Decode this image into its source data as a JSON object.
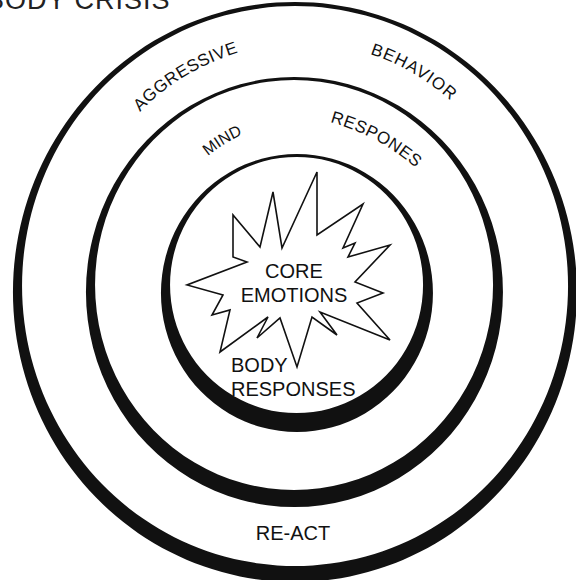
{
  "title": "BODY CRISIS",
  "rings": {
    "outer": {
      "label_left": "AGGRESSIVE",
      "label_right": "BEHAVIOR",
      "label_bottom": "RE-ACT"
    },
    "middle": {
      "label_left": "MIND",
      "label_right": "RESPONES"
    },
    "inner": {
      "label_bottom_line1": "BODY",
      "label_bottom_line2": "RESPONSES"
    }
  },
  "core": {
    "line1": "CORE",
    "line2": "EMOTIONS",
    "shape": "starburst"
  },
  "colors": {
    "ink": "#111111",
    "background": "#ffffff"
  }
}
